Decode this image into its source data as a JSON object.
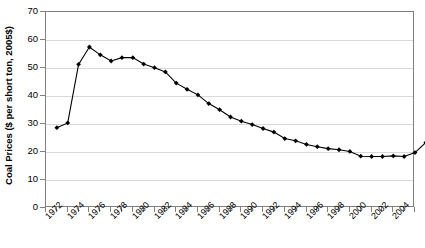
{
  "chart_data": {
    "type": "line",
    "title": "",
    "subtitle": "",
    "xlabel": "",
    "ylabel": "Coal Prices ($ per short ton, 2005$)",
    "ylim": [
      0,
      70
    ],
    "ytick_step": 10,
    "yticks": [
      0,
      10,
      20,
      30,
      40,
      50,
      60,
      70
    ],
    "ytick_labels": [
      "0",
      "10",
      "20",
      "30",
      "40",
      "50",
      "60",
      "70"
    ],
    "xlim": [
      1972,
      2006
    ],
    "xtick_labels": [
      "1972",
      "1974",
      "1976",
      "1978",
      "1980",
      "1982",
      "1984",
      "1986",
      "1988",
      "1990",
      "1992",
      "1994",
      "1996",
      "1998",
      "2000",
      "2002",
      "2004"
    ],
    "xtick_label_rotation": -45,
    "grid": "horizontal",
    "legend": "none",
    "marker": "diamond",
    "line_color": "#000000",
    "marker_color": "#000000",
    "grid_color": "#d9d9d9",
    "axis_color": "#808080",
    "x": [
      1973,
      1974,
      1975,
      1976,
      1977,
      1978,
      1979,
      1980,
      1981,
      1982,
      1983,
      1984,
      1985,
      1986,
      1987,
      1988,
      1989,
      1990,
      1991,
      1992,
      1993,
      1994,
      1995,
      1996,
      1997,
      1998,
      1999,
      2000,
      2001,
      2002,
      2003,
      2004,
      2005,
      2006
    ],
    "values": [
      28.7,
      30.4,
      51.3,
      57.5,
      54.7,
      52.5,
      53.7,
      53.7,
      51.4,
      50.1,
      48.6,
      44.6,
      42.4,
      40.4,
      37.3,
      35.1,
      32.5,
      31.0,
      29.8,
      28.4,
      27.1,
      24.8,
      24.0,
      22.7,
      21.9,
      21.2,
      20.8,
      20.2,
      18.5,
      18.4,
      18.4,
      18.6,
      18.4,
      19.8
    ],
    "last_point_extra": 23.4,
    "series": [
      {
        "name": "Coal Prices",
        "values": [
          28.7,
          30.4,
          51.3,
          57.5,
          54.7,
          52.5,
          53.7,
          53.7,
          51.4,
          50.1,
          48.6,
          44.6,
          42.4,
          40.4,
          37.3,
          35.1,
          32.5,
          31.0,
          29.8,
          28.4,
          27.1,
          24.8,
          24.0,
          22.7,
          21.9,
          21.2,
          20.8,
          20.2,
          18.5,
          18.4,
          18.4,
          18.6,
          18.4,
          19.8
        ]
      }
    ]
  }
}
